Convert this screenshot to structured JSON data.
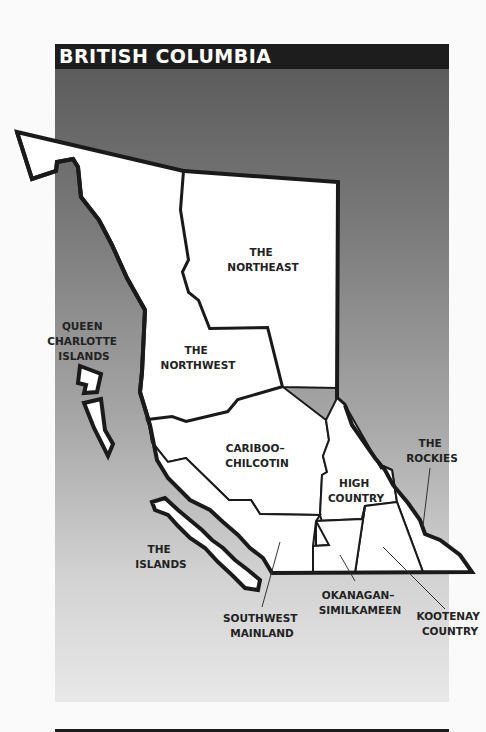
{
  "title": "BRITISH COLUMBIA",
  "colors": {
    "title_bar": "#1d1d1d",
    "title_text": "#ffffff",
    "land": "#ffffff",
    "border": "#1a1a1a",
    "label": "#222222"
  },
  "regions": [
    {
      "id": "northeast",
      "label_lines": [
        "THE",
        "NORTHEAST"
      ]
    },
    {
      "id": "northwest",
      "label_lines": [
        "THE",
        "NORTHWEST"
      ]
    },
    {
      "id": "queen-charlotte-islands",
      "label_lines": [
        "QUEEN",
        "CHARLOTTE",
        "ISLANDS"
      ]
    },
    {
      "id": "cariboo-chilcotin",
      "label_lines": [
        "CARIBOO–",
        "CHILCOTIN"
      ]
    },
    {
      "id": "high-country",
      "label_lines": [
        "HIGH",
        "COUNTRY"
      ]
    },
    {
      "id": "the-rockies",
      "label_lines": [
        "THE",
        "ROCKIES"
      ]
    },
    {
      "id": "the-islands",
      "label_lines": [
        "THE",
        "ISLANDS"
      ]
    },
    {
      "id": "southwest-mainland",
      "label_lines": [
        "SOUTHWEST",
        "MAINLAND"
      ]
    },
    {
      "id": "okanagan-similkameen",
      "label_lines": [
        "OKANAGAN–",
        "SIMILKAMEEN"
      ]
    },
    {
      "id": "kootenay-country",
      "label_lines": [
        "KOOTENAY",
        "COUNTRY"
      ]
    }
  ]
}
